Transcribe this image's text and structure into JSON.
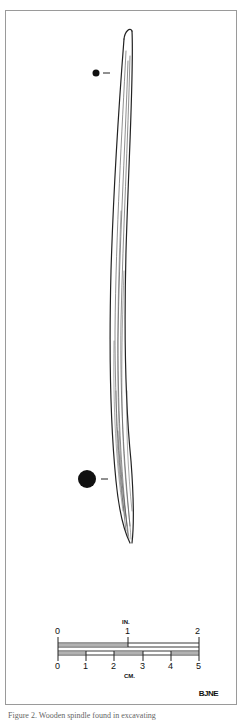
{
  "figure": {
    "illustration": "wooden-spindle-drawing",
    "cross_section_markers": [
      {
        "position": "upper",
        "size": "small"
      },
      {
        "position": "lower",
        "size": "large"
      }
    ],
    "scale_bar": {
      "inches": {
        "unit_label": "IN.",
        "ticks": [
          "0",
          "1",
          "2"
        ]
      },
      "centimeters": {
        "unit_label": "CM.",
        "ticks": [
          "0",
          "1",
          "2",
          "3",
          "4",
          "5"
        ]
      }
    },
    "artist_initials": "BJNE"
  },
  "caption": {
    "text": "Figure 2. Wooden spindle found in excavating"
  }
}
